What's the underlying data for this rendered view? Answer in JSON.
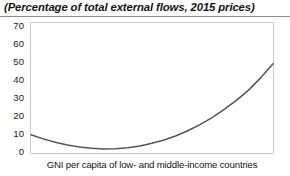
{
  "chart_data": {
    "type": "line",
    "title": "(Percentage of total external flows, 2015 prices)",
    "subtitle": "",
    "xlabel": "GNI per capita of low- and middle-income countries",
    "ylabel": "",
    "ylim": [
      0,
      70
    ],
    "yticks": [
      70,
      60,
      50,
      40,
      30,
      20,
      10,
      0
    ],
    "ytick_labels": [
      "70",
      "60",
      "50",
      "40",
      "30",
      "20",
      "10",
      "0"
    ],
    "xticks": [],
    "xtick_labels": [],
    "grid": false,
    "legend": null,
    "annotations": [],
    "series": [
      {
        "name": "Share of total external flows",
        "color": "#555555",
        "x": [
          0,
          5,
          10,
          15,
          20,
          25,
          30,
          35,
          40,
          45,
          50,
          55,
          60,
          65,
          70,
          75,
          80,
          85,
          90,
          95,
          100
        ],
        "values": [
          9.8,
          7.6,
          5.8,
          4.3,
          3.2,
          2.5,
          2.2,
          2.3,
          2.8,
          3.8,
          5.2,
          7.0,
          9.3,
          12.1,
          15.4,
          19.2,
          23.6,
          28.5,
          34.0,
          40.6,
          48.0
        ]
      }
    ]
  },
  "axis": {
    "y_ticks": [
      {
        "label": "70",
        "value": 70
      },
      {
        "label": "60",
        "value": 60
      },
      {
        "label": "50",
        "value": 50
      },
      {
        "label": "40",
        "value": 40
      },
      {
        "label": "30",
        "value": 30
      },
      {
        "label": "20",
        "value": 20
      },
      {
        "label": "10",
        "value": 10
      },
      {
        "label": "0",
        "value": 0
      }
    ]
  }
}
